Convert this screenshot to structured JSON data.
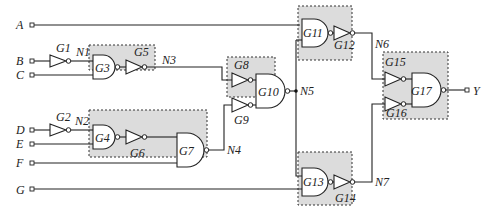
{
  "inputs": [
    {
      "name": "A"
    },
    {
      "name": "B"
    },
    {
      "name": "C"
    },
    {
      "name": "D"
    },
    {
      "name": "E"
    },
    {
      "name": "F"
    },
    {
      "name": "G"
    }
  ],
  "output": {
    "name": "Y"
  },
  "gates": {
    "G1": "G1",
    "G2": "G2",
    "G3": "G3",
    "G4": "G4",
    "G5": "G5",
    "G6": "G6",
    "G7": "G7",
    "G8": "G8",
    "G9": "G9",
    "G10": "G10",
    "G11": "G11",
    "G12": "G12",
    "G13": "G13",
    "G14": "G14",
    "G15": "G15",
    "G16": "G16",
    "G17": "G17"
  },
  "nets": {
    "N1": "N1",
    "N2": "N2",
    "N3": "N3",
    "N4": "N4",
    "N5": "N5",
    "N6": "N6",
    "N7": "N7"
  },
  "colors": {
    "group_fill": "#dcdcdc",
    "line": "#222222"
  }
}
